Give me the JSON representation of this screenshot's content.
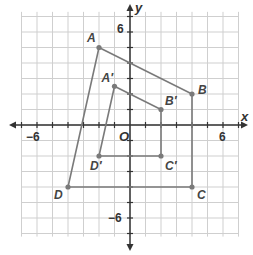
{
  "diagram": {
    "type": "coordinate-plane-dilation",
    "axes": {
      "x_label": "x",
      "y_label": "y",
      "origin_label": "O",
      "range": [
        -7,
        7
      ],
      "ticks": {
        "x_neg": "−6",
        "x_pos": "6",
        "y_pos": "6",
        "y_neg": "−6"
      }
    },
    "original": {
      "name": "ABCD",
      "vertices": [
        {
          "label": "A",
          "x": -2,
          "y": 5
        },
        {
          "label": "B",
          "x": 4,
          "y": 2
        },
        {
          "label": "C",
          "x": 4,
          "y": -4
        },
        {
          "label": "D",
          "x": -4,
          "y": -4
        }
      ]
    },
    "image": {
      "name": "A'B'C'D'",
      "vertices": [
        {
          "label": "A′",
          "x": -1,
          "y": 2.5
        },
        {
          "label": "B′",
          "x": 2,
          "y": 1
        },
        {
          "label": "C′",
          "x": 2,
          "y": -2
        },
        {
          "label": "D′",
          "x": -2,
          "y": -2
        }
      ]
    },
    "colors": {
      "grid": "#cfcfcf",
      "axis": "#333333",
      "polygon": "#7a7a7a",
      "label": "#444444"
    }
  }
}
